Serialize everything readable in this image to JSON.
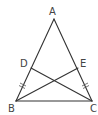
{
  "diagram": {
    "type": "geometry",
    "figure": "isosceles triangle with two intersecting cevians",
    "points": {
      "A": {
        "label": "A",
        "x": 54,
        "y": 19
      },
      "B": {
        "label": "B",
        "x": 16,
        "y": 101
      },
      "C": {
        "label": "C",
        "x": 92,
        "y": 101
      },
      "D": {
        "label": "D",
        "x": 31,
        "y": 68
      },
      "E": {
        "label": "E",
        "x": 78,
        "y": 68
      }
    },
    "segments": [
      [
        "A",
        "B"
      ],
      [
        "A",
        "C"
      ],
      [
        "B",
        "C"
      ],
      [
        "D",
        "C"
      ],
      [
        "E",
        "B"
      ]
    ],
    "equal_marks": [
      {
        "segment": [
          "B",
          "D"
        ],
        "ticks": 1
      },
      {
        "segment": [
          "C",
          "E"
        ],
        "ticks": 1
      }
    ],
    "colors": {
      "line": "#333333",
      "label": "#444444",
      "background": "#ffffff"
    }
  }
}
